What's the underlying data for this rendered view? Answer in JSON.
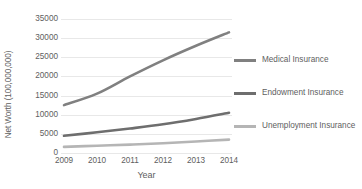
{
  "chart_data": {
    "type": "line",
    "title": "",
    "xlabel": "Year",
    "ylabel": "Net Worth (100,000,000)",
    "categories": [
      "2009",
      "2010",
      "2011",
      "2012",
      "2013",
      "2014"
    ],
    "x": [
      2009,
      2010,
      2011,
      2012,
      2013,
      2014
    ],
    "ylim": [
      0,
      35000
    ],
    "yticks": [
      0,
      5000,
      10000,
      15000,
      20000,
      25000,
      30000,
      35000
    ],
    "ytick_labels": [
      "0",
      "5000",
      "10000",
      "15000",
      "20000",
      "25000",
      "30000",
      "35000"
    ],
    "grid": "horizontal",
    "legend_position": "right",
    "series": [
      {
        "name": "Medical Insurance",
        "color": "#808080",
        "values": [
          12500,
          15500,
          20000,
          24200,
          28000,
          31500
        ]
      },
      {
        "name": "Endowment Insurance",
        "color": "#6e6e6e",
        "values": [
          4500,
          5400,
          6400,
          7500,
          8900,
          10500
        ]
      },
      {
        "name": "Unemployment Insurance",
        "color": "#b5b5b5",
        "values": [
          1600,
          1900,
          2200,
          2550,
          3000,
          3500
        ]
      }
    ]
  },
  "style": {
    "background": "#ffffff",
    "gridline_color": "#e8e8e8",
    "text_color": "#606060"
  }
}
